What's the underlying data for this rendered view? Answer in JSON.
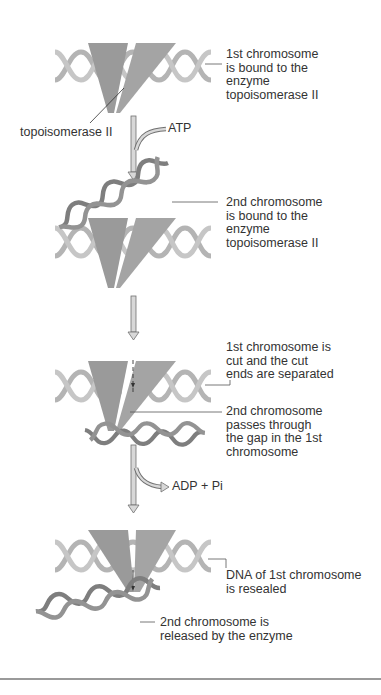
{
  "figure": {
    "steps": [
      {
        "id": "step1",
        "label": "1st chromosome\nis bound to the\nenzyme\ntopoisomerase II"
      },
      {
        "id": "step2",
        "label": "2nd chromosome\nis bound to the\nenzyme\ntopoisomerase II"
      },
      {
        "id": "step3",
        "label_cut": "1st chromosome is\ncut and the cut\nends are separated",
        "label_pass": "2nd chromosome\npasses through\nthe gap in the 1st\nchromosome"
      },
      {
        "id": "step4",
        "label_reseal": "DNA of 1st chromosome\nis resealed",
        "label_release": "2nd chromosome is\nreleased by the enzyme"
      }
    ],
    "enzyme_label": "topoisomerase II",
    "arrows": {
      "atp_input": "ATP",
      "adp_output": "ADP + Pi"
    },
    "colors": {
      "enzyme": "#9a9a9a",
      "dna_first": "#b4b4b4",
      "dna_second": "#7e7e7e",
      "arrow_fill": "#d8d8d8",
      "arrow_stroke": "#707070",
      "leader_line": "#555555"
    }
  }
}
